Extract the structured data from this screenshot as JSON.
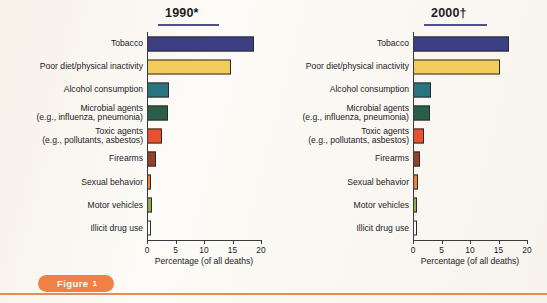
{
  "figure": {
    "caption_label": "Figure",
    "caption_number": "1"
  },
  "chart_data": [
    {
      "type": "bar",
      "orientation": "horizontal",
      "title": "1990*",
      "xlabel": "Percentage (of all deaths)",
      "ylabel": "",
      "xlim": [
        0,
        20
      ],
      "xticks": [
        "0",
        "5",
        "10",
        "15",
        "20"
      ],
      "grid": false,
      "legend": "none",
      "categories": [
        "Tobacco",
        "Poor diet/physical inactivity",
        "Alcohol consumption",
        "Microbial agents\n(e.g., influenza, pneumonia)",
        "Toxic agents\n(e.g., pollutants, asbestos)",
        "Firearms",
        "Sexual behavior",
        "Motor vehicles",
        "Illicit drug use"
      ],
      "values": [
        18.7,
        14.7,
        3.8,
        3.6,
        2.6,
        1.5,
        0.7,
        0.9,
        0.4
      ],
      "colors": [
        "#3d3f84",
        "#f2cd5d",
        "#2a7480",
        "#2a5e4a",
        "#e8512f",
        "#95412a",
        "#e98338",
        "#8fae4e",
        "#fbfbfb"
      ]
    },
    {
      "type": "bar",
      "orientation": "horizontal",
      "title": "2000†",
      "xlabel": "Percentage (of all deaths)",
      "ylabel": "",
      "xlim": [
        0,
        20
      ],
      "xticks": [
        "0",
        "5",
        "10",
        "15",
        "20"
      ],
      "grid": false,
      "legend": "none",
      "categories": [
        "Tobacco",
        "Poor diet/physical inactivity",
        "Alcohol consumption",
        "Microbial agents\n(e.g., influenza, pneumonia)",
        "Toxic agents\n(e.g., pollutants, asbestos)",
        "Firearms",
        "Sexual behavior",
        "Motor vehicles",
        "Illicit drug use"
      ],
      "values": [
        16.9,
        15.2,
        3.2,
        2.9,
        2.0,
        1.3,
        0.8,
        0.7,
        0.4
      ],
      "colors": [
        "#3d3f84",
        "#f2cd5d",
        "#2a7480",
        "#2a5e4a",
        "#e8512f",
        "#95412a",
        "#e98338",
        "#8fae4e",
        "#fbfbfb"
      ]
    }
  ],
  "style": {
    "title_rule_color": "#4d4f8e",
    "accent_orange": "#ef8048",
    "bar_outline": "#2a2a2a"
  }
}
